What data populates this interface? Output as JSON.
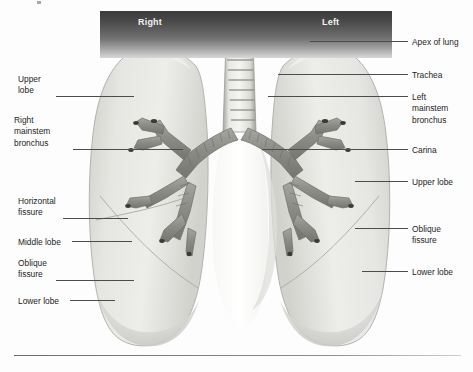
{
  "figure": {
    "banner": {
      "right_label": "Right",
      "left_label": "Left"
    },
    "colors": {
      "lung_fill": "#e3e3e0",
      "lung_edge": "#b9b9b4",
      "bronchus": "#8f8f8a",
      "banner_dark": "#3b3b3b",
      "leader_line": "#4c4c4c",
      "text": "#1d1d1d"
    }
  },
  "labels": {
    "left": [
      {
        "id": "upper-lobe-left-col",
        "text": "Upper\nlobe",
        "x": 18,
        "y": 74,
        "leader_x": 56,
        "leader_y": 96,
        "leader_w": 78
      },
      {
        "id": "right-mainstem-bronchus",
        "text": "Right\nmainstem\nbronchus",
        "x": 14,
        "y": 115,
        "leader_x": 73,
        "leader_y": 149,
        "leader_w": 110
      },
      {
        "id": "horizontal-fissure",
        "text": "Horizontal\nfissure",
        "x": 18,
        "y": 196,
        "leader_x": 63,
        "leader_y": 218,
        "leader_w": 65
      },
      {
        "id": "middle-lobe",
        "text": "Middle lobe",
        "x": 18,
        "y": 237,
        "leader_x": 72,
        "leader_y": 241,
        "leader_w": 60
      },
      {
        "id": "oblique-fissure-left",
        "text": "Oblique\nfissure",
        "x": 18,
        "y": 258,
        "leader_x": 56,
        "leader_y": 280,
        "leader_w": 78
      },
      {
        "id": "lower-lobe-left-col",
        "text": "Lower lobe",
        "x": 18,
        "y": 296,
        "leader_x": 70,
        "leader_y": 300,
        "leader_w": 45
      }
    ],
    "right": [
      {
        "id": "apex-of-lung",
        "text": "Apex of lung",
        "x": 412,
        "y": 37,
        "leader_x": 310,
        "leader_y": 41,
        "leader_w": 98
      },
      {
        "id": "trachea",
        "text": "Trachea",
        "x": 412,
        "y": 70,
        "leader_x": 278,
        "leader_y": 74,
        "leader_w": 130
      },
      {
        "id": "left-mainstem-bronchus",
        "text": "Left\nmainstem\nbronchus",
        "x": 412,
        "y": 92,
        "leader_x": 268,
        "leader_y": 96,
        "leader_w": 140
      },
      {
        "id": "carina",
        "text": "Carina",
        "x": 412,
        "y": 145,
        "leader_x": 262,
        "leader_y": 149,
        "leader_w": 146
      },
      {
        "id": "upper-lobe-right-col",
        "text": "Upper lobe",
        "x": 412,
        "y": 177,
        "leader_x": 355,
        "leader_y": 181,
        "leader_w": 53
      },
      {
        "id": "oblique-fissure-right",
        "text": "Oblique\nfissure",
        "x": 412,
        "y": 224,
        "leader_x": 355,
        "leader_y": 228,
        "leader_w": 53
      },
      {
        "id": "lower-lobe-right-col",
        "text": "Lower lobe",
        "x": 412,
        "y": 267,
        "leader_x": 362,
        "leader_y": 271,
        "leader_w": 46
      }
    ]
  },
  "anatomy": {
    "structures": [
      "right lung",
      "left lung",
      "trachea",
      "carina",
      "right mainstem bronchus",
      "left mainstem bronchus",
      "lobar bronchi",
      "horizontal fissure",
      "oblique fissure",
      "apex of lung"
    ]
  }
}
